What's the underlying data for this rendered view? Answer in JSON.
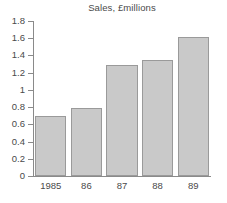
{
  "chart_data": {
    "type": "bar",
    "title": "Sales, £millions",
    "xlabel": "",
    "ylabel": "",
    "categories": [
      "1985",
      "86",
      "87",
      "88",
      "89"
    ],
    "values": [
      0.7,
      0.79,
      1.29,
      1.35,
      1.61
    ],
    "ylim": [
      0,
      1.8
    ],
    "ytick_step": 0.2,
    "ytick_labels": [
      "0",
      "0.2",
      "0.4",
      "0.6",
      "0.8",
      "1",
      "1.2",
      "1.4",
      "1.6",
      "1.8"
    ],
    "ytick_values": [
      0,
      0.2,
      0.4,
      0.6,
      0.8,
      1.0,
      1.2,
      1.4,
      1.6,
      1.8
    ],
    "grid": false,
    "legend": false,
    "legend_position": "none",
    "series": [
      {
        "name": "Sales",
        "values": [
          0.7,
          0.79,
          1.29,
          1.35,
          1.61
        ]
      }
    ],
    "colors": {
      "bar_fill": "#c9c9c9",
      "bar_border": "#9a9a9a",
      "axis": "#8a8a8a",
      "text": "#4a4a4a",
      "background": "#ffffff"
    }
  }
}
